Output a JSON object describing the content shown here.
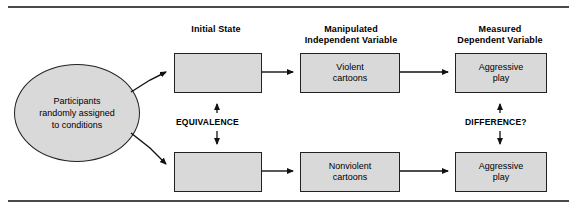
{
  "diagram": {
    "title": "",
    "column_headers": [
      {
        "id": "initial-state",
        "label": "Initial State",
        "x": 170,
        "y": 22,
        "w": 92
      },
      {
        "id": "manipulated-iv",
        "label": "Manipulated\nIndependent Variable",
        "x": 288,
        "y": 22,
        "w": 122
      },
      {
        "id": "measured-dv",
        "label": "Measured\nDependent Variable",
        "x": 440,
        "y": 22,
        "w": 122
      }
    ],
    "source_node": {
      "id": "participants",
      "label": "Participants\nrandomly assigned\nto conditions"
    },
    "nodes": [
      {
        "id": "initial-state-top",
        "label": ""
      },
      {
        "id": "initial-state-bottom",
        "label": ""
      },
      {
        "id": "iv-top",
        "label": "Violent\ncartoons"
      },
      {
        "id": "iv-bottom",
        "label": "Nonvolent\ncartoons"
      },
      {
        "id": "dv-top",
        "label": "Aggressive\nplay"
      },
      {
        "id": "dv-bottom",
        "label": "Aggressive\nplay"
      }
    ],
    "annotations": [
      {
        "id": "equivalence",
        "label": "EQUIVALENCE"
      },
      {
        "id": "difference",
        "label": "DIFFERENCE?"
      }
    ],
    "colors": {
      "box_fill": "#d9d9d9",
      "box_stroke": "#222222",
      "rule": "#4a4a4a",
      "text": "#000000"
    }
  }
}
